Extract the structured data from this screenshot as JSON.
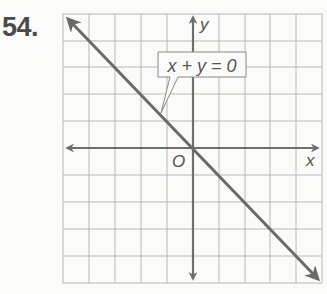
{
  "problem_number": "54.",
  "graph": {
    "equation_label": "x + y = 0",
    "x_axis_label": "x",
    "y_axis_label": "y",
    "origin_label": "O",
    "grid": {
      "columns": 10,
      "rows": 10,
      "cell_px": 25.8
    },
    "line": {
      "slope": -1,
      "intercept": 0,
      "description": "line through origin with arrows at both ends"
    },
    "colors": {
      "grid": "#b5b5b5",
      "axes": "#6e6e6e",
      "line": "#6a6a6a",
      "text": "#555555"
    }
  }
}
